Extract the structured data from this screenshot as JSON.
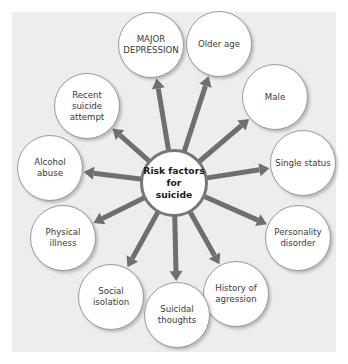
{
  "diagram": {
    "center": {
      "label": "Risk factors\nfor\nsuicide",
      "x": 174,
      "y": 183,
      "r": 34
    },
    "arrow_color": "#6f6f6f",
    "panel_color": "#ededed",
    "nodes": [
      {
        "id": "major-depression",
        "label": "MAJOR\nDEPRESSION",
        "x": 151,
        "y": 45,
        "r": 33
      },
      {
        "id": "older-age",
        "label": "Older age",
        "x": 219,
        "y": 44,
        "r": 33
      },
      {
        "id": "recent-suicide-attempt",
        "label": "Recent\nsuicide\nattempt",
        "x": 87,
        "y": 106,
        "r": 33
      },
      {
        "id": "male",
        "label": "Male",
        "x": 275,
        "y": 97,
        "r": 33
      },
      {
        "id": "alcohol-abuse",
        "label": "Alcohol\nabuse",
        "x": 50,
        "y": 168,
        "r": 33
      },
      {
        "id": "single-status",
        "label": "Single status",
        "x": 303,
        "y": 163,
        "r": 33
      },
      {
        "id": "physical-illness",
        "label": "Physical\nillness",
        "x": 63,
        "y": 238,
        "r": 33
      },
      {
        "id": "personality-disorder",
        "label": "Personality\ndisorder",
        "x": 298,
        "y": 238,
        "r": 33
      },
      {
        "id": "social-isolation",
        "label": "Social\nisolation",
        "x": 111,
        "y": 297,
        "r": 33
      },
      {
        "id": "history-of-agression",
        "label": "History of\nagression",
        "x": 236,
        "y": 294,
        "r": 33
      },
      {
        "id": "suicidal-thoughts",
        "label": "Suicidal\nthoughts",
        "x": 177,
        "y": 315,
        "r": 33
      }
    ]
  }
}
